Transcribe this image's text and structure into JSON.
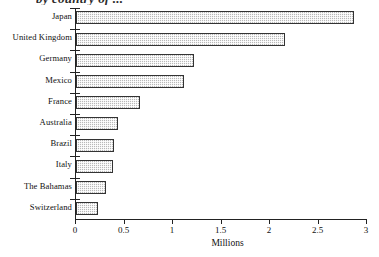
{
  "chart_data": {
    "type": "bar",
    "orientation": "horizontal",
    "title": "by country of ...",
    "xlabel": "Millions",
    "ylabel": "",
    "categories": [
      "Japan",
      "United Kingdom",
      "Germany",
      "Mexico",
      "France",
      "Australia",
      "Brazil",
      "Italy",
      "The Bahamas",
      "Switzerland"
    ],
    "values": [
      2.87,
      2.15,
      1.22,
      1.11,
      0.66,
      0.43,
      0.39,
      0.38,
      0.31,
      0.23
    ],
    "xlim": [
      0,
      3
    ],
    "xticks": [
      0,
      0.5,
      1,
      1.5,
      2,
      2.5,
      3
    ],
    "xtick_labels": [
      "0",
      "0.5",
      "1",
      "1.5",
      "2",
      "2.5",
      "3"
    ],
    "grid": false,
    "legend": null,
    "bar_fill": "#b9b9b9",
    "bar_border": "#333333",
    "axis_color": "#222222",
    "background": "#ffffff"
  },
  "footer": {
    "source_note": ""
  }
}
